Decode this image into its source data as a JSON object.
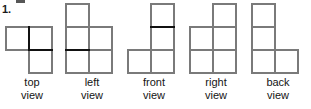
{
  "problem": {
    "number": "1."
  },
  "figure": {
    "caption_words": [
      "view"
    ],
    "stroke_colors": {
      "outline": "#7a7a7a",
      "emphasis": "#111111",
      "label_text": "#141414"
    },
    "cell_size": 23,
    "views": [
      {
        "id": "top",
        "label_line1": "top",
        "label_line2": "view",
        "origin_x": 6,
        "origin_y": 27,
        "cols": 2,
        "rows": 2,
        "cells": [
          [
            0,
            0
          ],
          [
            1,
            0
          ],
          [
            1,
            1
          ]
        ],
        "emphasis_edges": [
          {
            "type": "v",
            "col": 1,
            "row": 0
          },
          {
            "type": "h",
            "col": 1,
            "row": 1
          }
        ],
        "label_top": 76,
        "group_left": 0,
        "group_width": 64
      },
      {
        "id": "left",
        "label_line1": "left",
        "label_line2": "view",
        "origin_x": 6,
        "origin_y": 4,
        "cols": 2,
        "rows": 3,
        "cells": [
          [
            0,
            0
          ],
          [
            0,
            1
          ],
          [
            1,
            1
          ],
          [
            0,
            2
          ],
          [
            1,
            2
          ]
        ],
        "emphasis_edges": [
          {
            "type": "h",
            "col": 0,
            "row": 2
          }
        ],
        "label_top": 76,
        "group_left": 60,
        "group_width": 64
      },
      {
        "id": "front",
        "label_line1": "front",
        "label_line2": "view",
        "origin_x": 6,
        "origin_y": 4,
        "cols": 2,
        "rows": 3,
        "cells": [
          [
            1,
            0
          ],
          [
            1,
            1
          ],
          [
            0,
            2
          ],
          [
            1,
            2
          ]
        ],
        "emphasis_edges": [
          {
            "type": "h",
            "col": 1,
            "row": 1
          }
        ],
        "label_top": 76,
        "group_left": 122,
        "group_width": 64
      },
      {
        "id": "right",
        "label_line1": "right",
        "label_line2": "view",
        "origin_x": 6,
        "origin_y": 4,
        "cols": 2,
        "rows": 3,
        "cells": [
          [
            1,
            0
          ],
          [
            0,
            1
          ],
          [
            1,
            1
          ],
          [
            0,
            2
          ],
          [
            1,
            2
          ]
        ],
        "emphasis_edges": [],
        "label_top": 76,
        "group_left": 184,
        "group_width": 64
      },
      {
        "id": "back",
        "label_line1": "back",
        "label_line2": "view",
        "origin_x": 6,
        "origin_y": 4,
        "cols": 2,
        "rows": 3,
        "cells": [
          [
            0,
            0
          ],
          [
            0,
            1
          ],
          [
            0,
            2
          ],
          [
            1,
            2
          ]
        ],
        "emphasis_edges": [],
        "label_top": 76,
        "group_left": 246,
        "group_width": 64
      }
    ]
  }
}
